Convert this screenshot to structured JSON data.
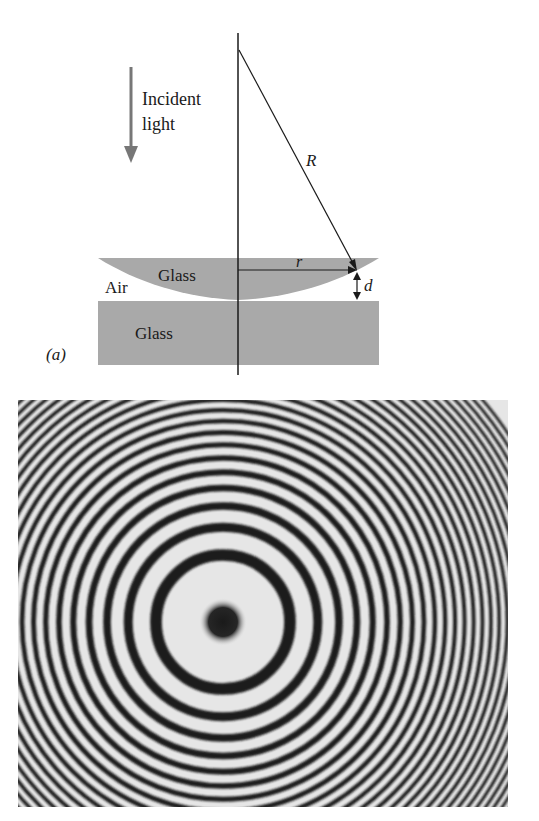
{
  "figure": {
    "panel_label": "(a)",
    "incident": {
      "line1": "Incident",
      "line2": "light",
      "arrow_color": "#777777"
    },
    "labels": {
      "radius_big": "R",
      "radius_small": "r",
      "gap": "d",
      "air": "Air",
      "lens_material": "Glass",
      "plate_material": "Glass"
    },
    "colors": {
      "glass": "#a9a9a9",
      "line": "#1a1a1a",
      "background": "#ffffff"
    }
  },
  "chart_data": {
    "type": "diagram",
    "diagram": {
      "elements": [
        "incident light arrow",
        "plano-convex glass lens",
        "flat glass plate",
        "air gap",
        "radius of curvature R",
        "radial distance r",
        "gap thickness d",
        "optical axis"
      ]
    },
    "rings_photo": {
      "center_px": [
        205,
        222
      ],
      "central_spot_radius_px": 16,
      "first_dark_ring_radius_px": 67,
      "ring_radius_law": "r_n = 67 * sqrt(n)",
      "ring_count": 26,
      "dark_color": "#1a1a1a",
      "light_color": "#e6e6e6"
    }
  }
}
